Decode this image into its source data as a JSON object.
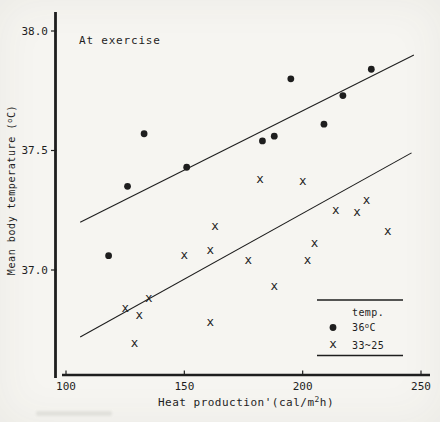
{
  "chart_data": {
    "type": "scatter",
    "annotation": "At exercise",
    "xlabel": "Heat production'(cal/m2h)",
    "ylabel": "Mean body temperature (oC)",
    "xlabel_rich": [
      {
        "t": "Heat production'(cal/m"
      },
      {
        "t": "2",
        "sup": true
      },
      {
        "t": "h)"
      }
    ],
    "ylabel_rich": [
      {
        "t": "Mean body temperature ("
      },
      {
        "t": "o",
        "sup": true
      },
      {
        "t": "C)"
      }
    ],
    "x_ticks": [
      "100",
      "150",
      "200",
      "250"
    ],
    "y_ticks": [
      "38.0",
      "37.5",
      "37.0"
    ],
    "xlim": [
      98,
      255
    ],
    "ylim": [
      36.55,
      38.09
    ],
    "grid": false,
    "ink_color": "#1e1e1e",
    "paper_color": "#f6f5f1",
    "legend": {
      "title": "temp.",
      "position": "lower-right",
      "entries": [
        {
          "marker": "dot",
          "label": "36oC",
          "label_rich": [
            {
              "t": "36"
            },
            {
              "t": "o",
              "sup": true
            },
            {
              "t": "C"
            }
          ]
        },
        {
          "marker": "x",
          "label": "33~25",
          "label_rich": [
            {
              "t": "33~25"
            }
          ]
        }
      ]
    },
    "series": [
      {
        "name": "36oC",
        "marker": "dot",
        "points": [
          [
            118,
            37.06
          ],
          [
            126,
            37.35
          ],
          [
            133,
            37.57
          ],
          [
            151,
            37.43
          ],
          [
            183,
            37.54
          ],
          [
            188,
            37.56
          ],
          [
            195,
            37.8
          ],
          [
            209,
            37.61
          ],
          [
            217,
            37.73
          ],
          [
            229,
            37.84
          ]
        ]
      },
      {
        "name": "33~25",
        "marker": "x",
        "points": [
          [
            125,
            36.84
          ],
          [
            129,
            36.69
          ],
          [
            131,
            36.81
          ],
          [
            135,
            36.88
          ],
          [
            150,
            37.06
          ],
          [
            161,
            37.08
          ],
          [
            161,
            36.78
          ],
          [
            163,
            37.18
          ],
          [
            177,
            37.04
          ],
          [
            182,
            37.38
          ],
          [
            188,
            36.93
          ],
          [
            200,
            37.37
          ],
          [
            202,
            37.04
          ],
          [
            205,
            37.11
          ],
          [
            214,
            37.25
          ],
          [
            223,
            37.24
          ],
          [
            227,
            37.29
          ],
          [
            236,
            37.16
          ]
        ]
      }
    ],
    "trend_lines": [
      {
        "series": "36oC",
        "x1": 106,
        "y1": 37.2,
        "x2": 247,
        "y2": 37.9
      },
      {
        "series": "33~25",
        "x1": 106,
        "y1": 36.72,
        "x2": 246,
        "y2": 37.49
      }
    ]
  }
}
